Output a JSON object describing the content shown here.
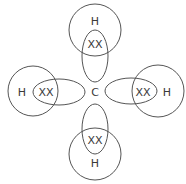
{
  "diagram": {
    "type": "dot-and-cross-diagram",
    "molecule": "methane",
    "center_atom": {
      "symbol": "C"
    },
    "bonds": [
      {
        "position": "top",
        "atom": "H",
        "shared_electrons": "XX"
      },
      {
        "position": "left",
        "atom": "H",
        "shared_electrons": "XX"
      },
      {
        "position": "right",
        "atom": "H",
        "shared_electrons": "XX"
      },
      {
        "position": "bottom",
        "atom": "H",
        "shared_electrons": "XX"
      }
    ],
    "colors": {
      "stroke": "#555555",
      "text": "#3a3a3a",
      "background": "#ffffff"
    }
  }
}
